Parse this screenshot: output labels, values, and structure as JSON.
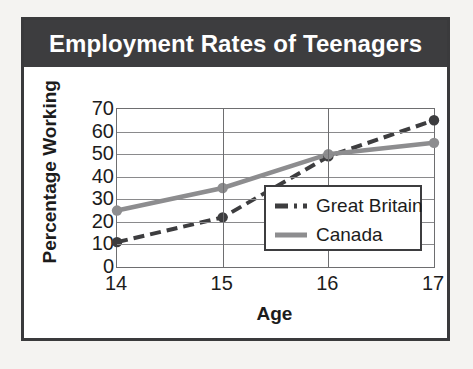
{
  "figure": {
    "title": "Employment Rates of Teenagers",
    "title_color": "#ffffff",
    "banner_color": "#3d3d3f",
    "frame_color": "#3a3a3c",
    "background_color": "#ffffff",
    "page_background_color": "#f4f3f1"
  },
  "chart_data": {
    "type": "line",
    "title": "Employment Rates of Teenagers",
    "xlabel": "Age",
    "ylabel": "Percentage Working",
    "x": [
      14,
      15,
      16,
      17
    ],
    "categories": [
      "14",
      "15",
      "16",
      "17"
    ],
    "xlim": [
      14,
      17
    ],
    "ylim": [
      0,
      70
    ],
    "yticks": [
      0,
      10,
      20,
      30,
      40,
      50,
      60,
      70
    ],
    "ytick_labels": [
      "0",
      "10",
      "20",
      "30",
      "40",
      "50",
      "60",
      "70"
    ],
    "xtick_labels": [
      "14",
      "15",
      "16",
      "17"
    ],
    "grid": true,
    "grid_orientation": "both",
    "legend_position": "center-right",
    "series": [
      {
        "name": "Great Britain",
        "values": [
          11,
          22,
          49,
          65
        ],
        "color": "#3d3d3f",
        "style": "dashed",
        "marker": "circle"
      },
      {
        "name": "Canada",
        "values": [
          25,
          35,
          50,
          55
        ],
        "color": "#8d8d8f",
        "style": "solid",
        "marker": "circle"
      }
    ]
  },
  "legend": {
    "entries": [
      {
        "label": "Great Britain",
        "swatch": "dashed-dark-line"
      },
      {
        "label": "Canada",
        "swatch": "solid-gray-line"
      }
    ]
  }
}
